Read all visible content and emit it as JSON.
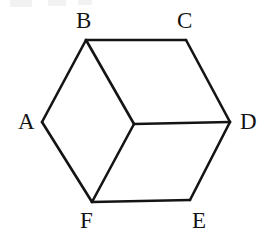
{
  "figure": {
    "type": "line-diagram",
    "canvas": {
      "width": 280,
      "height": 240
    },
    "background_color": "#ffffff",
    "stroke_color": "#141414",
    "stroke_width": 2.6,
    "label_color": "#141414",
    "label_font_size": 23,
    "vertices": [
      {
        "id": "A",
        "label": "A",
        "x": 42,
        "y": 122
      },
      {
        "id": "B",
        "label": "B",
        "x": 86,
        "y": 40
      },
      {
        "id": "C",
        "label": "C",
        "x": 186,
        "y": 40
      },
      {
        "id": "D",
        "label": "D",
        "x": 230,
        "y": 122
      },
      {
        "id": "E",
        "label": "E",
        "x": 190,
        "y": 200
      },
      {
        "id": "F",
        "label": "F",
        "x": 92,
        "y": 202
      },
      {
        "id": "G",
        "label": "",
        "x": 134,
        "y": 124
      }
    ],
    "edges": [
      {
        "from": "A",
        "to": "B",
        "kind": "outer"
      },
      {
        "from": "B",
        "to": "C",
        "kind": "outer"
      },
      {
        "from": "C",
        "to": "D",
        "kind": "outer"
      },
      {
        "from": "D",
        "to": "E",
        "kind": "outer"
      },
      {
        "from": "E",
        "to": "F",
        "kind": "outer"
      },
      {
        "from": "F",
        "to": "A",
        "kind": "outer"
      },
      {
        "from": "B",
        "to": "G",
        "kind": "inner"
      },
      {
        "from": "G",
        "to": "D",
        "kind": "inner"
      },
      {
        "from": "G",
        "to": "F",
        "kind": "inner"
      }
    ],
    "labels": [
      {
        "id": "A",
        "text": "A",
        "x": 18,
        "y": 110
      },
      {
        "id": "B",
        "text": "B",
        "x": 76,
        "y": 9
      },
      {
        "id": "C",
        "text": "C",
        "x": 177,
        "y": 9
      },
      {
        "id": "D",
        "text": "D",
        "x": 240,
        "y": 110
      },
      {
        "id": "E",
        "text": "E",
        "x": 192,
        "y": 209
      },
      {
        "id": "F",
        "text": "F",
        "x": 80,
        "y": 209
      }
    ]
  }
}
